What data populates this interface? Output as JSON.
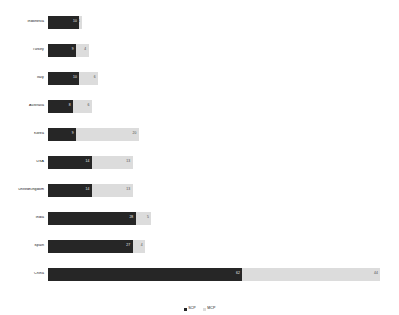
{
  "chart_data": {
    "type": "bar",
    "orientation": "horizontal",
    "stacked": true,
    "title": "",
    "xlabel": "",
    "ylabel": "",
    "grid": false,
    "legend_position": "bottom",
    "xlim": [
      0,
      110
    ],
    "categories": [
      "Indonesia",
      "Turkey",
      "Italy",
      "Australia",
      "Korea",
      "USA",
      "UnitedKingdom",
      "India",
      "Spain",
      "China"
    ],
    "series": [
      {
        "name": "SCP",
        "color": "#262626",
        "values": [
          10,
          9,
          10,
          8,
          9,
          14,
          14,
          28,
          27,
          62
        ]
      },
      {
        "name": "MCP",
        "color": "#dcdcdc",
        "values": [
          1,
          4,
          6,
          6,
          20,
          13,
          13,
          5,
          4,
          44
        ]
      }
    ]
  },
  "legend": {
    "items": [
      {
        "label": "SCP",
        "color": "#262626"
      },
      {
        "label": "MCP",
        "color": "#dcdcdc"
      }
    ]
  }
}
